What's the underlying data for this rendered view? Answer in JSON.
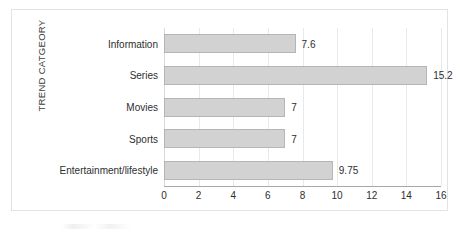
{
  "chart_data": {
    "type": "bar",
    "orientation": "horizontal",
    "title": "",
    "xlabel": "",
    "ylabel": "TREND CATGEORY",
    "categories": [
      "Information",
      "Series",
      "Movies",
      "Sports",
      "Entertainment/lifestyle"
    ],
    "values": [
      7.6,
      15.2,
      7,
      7,
      9.75
    ],
    "value_labels": [
      "7.6",
      "15.2",
      "7",
      "7",
      "9.75"
    ],
    "xlim": [
      0,
      16
    ],
    "xticks": [
      0,
      2,
      4,
      6,
      8,
      10,
      12,
      14,
      16
    ],
    "xtick_labels": [
      "0",
      "2",
      "4",
      "6",
      "8",
      "10",
      "12",
      "14",
      "16"
    ],
    "grid": "vertical",
    "legend": "none",
    "bar_fill_color": "#d2d2d2",
    "bar_border_color": "#b5b5b5",
    "gridline_color": "#e9e9e9",
    "axis_color": "#a8a8a8",
    "text_color": "#2e2e2e",
    "background_color": "#ffffff",
    "frame_border_color": "#e3e3e3"
  }
}
